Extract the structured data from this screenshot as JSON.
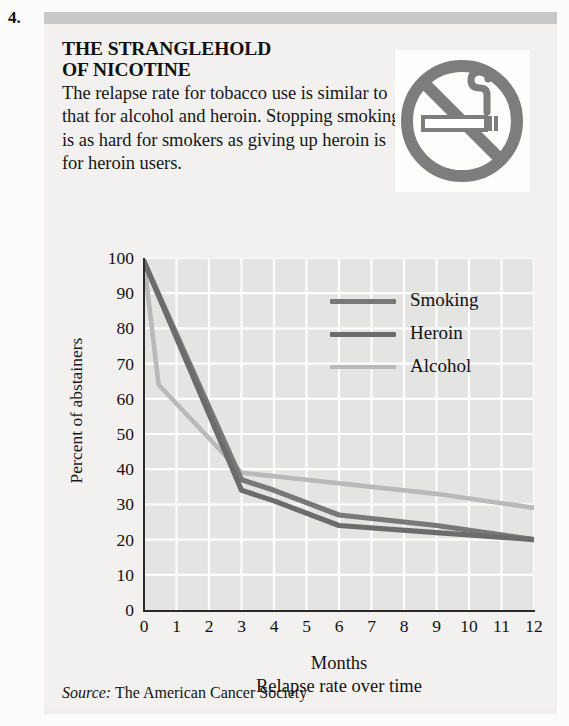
{
  "item_number": "4.",
  "headline": "THE STRANGLEHOLD\nOF NICOTINE",
  "headline_line1": "THE STRANGLEHOLD",
  "headline_line2": "OF NICOTINE",
  "blurb": "The relapse rate for tobacco use is similar to that for alcohol and heroin. Stopping smoking is as hard for smokers as giving up heroin is for heroin users.",
  "sign": {
    "name": "no-smoking-icon",
    "color": "#7d7d7d"
  },
  "source": {
    "label": "Source:",
    "text": " The American Cancer Society"
  },
  "colors": {
    "smoking": "#787878",
    "heroin": "#6c6c6c",
    "alcohol": "#b9b9b9",
    "plot_background": "#e4e4e3",
    "gridline": "#fdfdfd",
    "axis": "#2b2b2b",
    "panel_background": "#f2f1ef",
    "top_bar": "#c9c9c9"
  },
  "chart_data": {
    "type": "line",
    "title": "",
    "xlabel": "Months",
    "ylabel": "Percent of abstainers",
    "caption": "Relapse rate over time",
    "xlim": [
      0,
      12
    ],
    "ylim": [
      0,
      100
    ],
    "xticks": [
      0,
      1,
      2,
      3,
      4,
      5,
      6,
      7,
      8,
      9,
      10,
      11,
      12
    ],
    "yticks": [
      0,
      10,
      20,
      30,
      40,
      50,
      60,
      70,
      80,
      90,
      100
    ],
    "xtick_labels": [
      "0",
      "1",
      "2",
      "3",
      "4",
      "5",
      "6",
      "7",
      "8",
      "9",
      "10",
      "11",
      "12"
    ],
    "ytick_labels": [
      "0",
      "10",
      "20",
      "30",
      "40",
      "50",
      "60",
      "70",
      "80",
      "90",
      "100"
    ],
    "grid": true,
    "legend_position": "upper-right",
    "series": [
      {
        "name": "Smoking",
        "color": "#787878",
        "x": [
          0,
          3,
          4,
          6,
          9,
          12
        ],
        "y": [
          99,
          37,
          34,
          27,
          24,
          20
        ]
      },
      {
        "name": "Heroin",
        "color": "#6c6c6c",
        "x": [
          0,
          3,
          4,
          6,
          9,
          12
        ],
        "y": [
          99,
          34,
          31,
          24,
          22,
          20
        ]
      },
      {
        "name": "Alcohol",
        "color": "#b9b9b9",
        "x": [
          0,
          0.45,
          3,
          4,
          9,
          12
        ],
        "y": [
          99,
          64,
          39,
          38,
          33,
          29
        ]
      }
    ]
  }
}
